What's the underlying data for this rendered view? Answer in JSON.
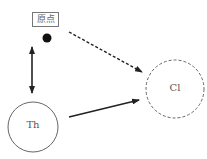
{
  "diagram": {
    "nodes": [
      {
        "id": "origin",
        "label": "原点",
        "shape": "box-with-dot"
      },
      {
        "id": "th",
        "label": "Th",
        "shape": "circle-solid"
      },
      {
        "id": "cl",
        "label": "Cl",
        "shape": "circle-dashed"
      }
    ],
    "edges": [
      {
        "from": "origin",
        "to": "th",
        "style": "solid",
        "direction": "bidirectional"
      },
      {
        "from": "origin",
        "to": "cl",
        "style": "dashed",
        "direction": "forward"
      },
      {
        "from": "th",
        "to": "cl",
        "style": "solid",
        "direction": "forward"
      }
    ],
    "colors": {
      "stroke": "#222222",
      "circle_stroke": "#666666",
      "text": "#555555"
    }
  }
}
